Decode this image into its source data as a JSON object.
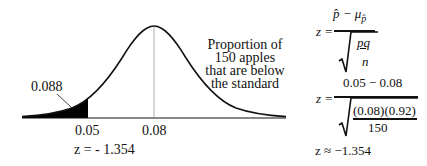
{
  "diagram": {
    "type": "normal-distribution-curve",
    "tail_area_label": "0.088",
    "x_axis_ticks": [
      {
        "label": "0.05",
        "role": "sample-proportion"
      },
      {
        "label": "0.08",
        "role": "mean"
      }
    ],
    "z_label": "z = - 1.354",
    "description_lines": [
      "Proportion of",
      "150 apples",
      "that are below",
      "the standard"
    ],
    "colors": {
      "curve": "#111111",
      "shaded_tail": "#000000",
      "background": "#ffffff"
    }
  },
  "formulas": {
    "general": {
      "lhs": "z =",
      "numerator": "p̂ − μ",
      "numerator_subscript": "p̂",
      "denominator_num": "pq",
      "denominator_den": "n"
    },
    "substituted": {
      "lhs": "z =",
      "numerator": "0.05 − 0.08",
      "denominator_num": "(0.08)(0.92)",
      "denominator_den": "150"
    },
    "result": "z ≈ −1.354"
  }
}
